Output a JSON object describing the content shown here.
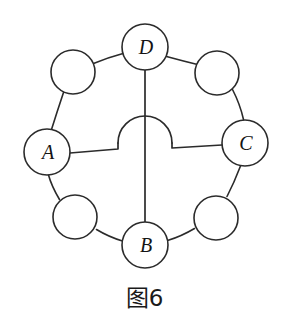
{
  "figure": {
    "caption": "图6",
    "background_color": "#ffffff",
    "stroke_color": "#2b2b2b",
    "label_color": "#141414"
  },
  "diagram": {
    "type": "ring-graph",
    "node_radius": 23,
    "ring_center": {
      "x": 145,
      "y": 145
    },
    "nodes": [
      {
        "id": "D",
        "label": "D",
        "labeled": true,
        "x": 145,
        "y": 47,
        "r": 23,
        "position": "top"
      },
      {
        "id": "NE",
        "label": "",
        "labeled": false,
        "x": 217,
        "y": 73,
        "r": 22,
        "position": "top-right"
      },
      {
        "id": "C",
        "label": "C",
        "labeled": true,
        "x": 245,
        "y": 143,
        "r": 23,
        "position": "right"
      },
      {
        "id": "SE",
        "label": "",
        "labeled": false,
        "x": 216,
        "y": 218,
        "r": 22,
        "position": "bottom-right"
      },
      {
        "id": "B",
        "label": "B",
        "labeled": true,
        "x": 145,
        "y": 245,
        "r": 23,
        "position": "bottom"
      },
      {
        "id": "SW",
        "label": "",
        "labeled": false,
        "x": 75,
        "y": 217,
        "r": 22,
        "position": "bottom-left"
      },
      {
        "id": "A",
        "label": "A",
        "labeled": true,
        "x": 47,
        "y": 152,
        "r": 23,
        "position": "left"
      },
      {
        "id": "NW",
        "label": "",
        "labeled": false,
        "x": 73,
        "y": 72,
        "r": 22,
        "position": "top-left"
      }
    ],
    "ring_edges": [
      {
        "from": "D",
        "to": "NE",
        "kind": "arc"
      },
      {
        "from": "NE",
        "to": "C",
        "kind": "arc"
      },
      {
        "from": "C",
        "to": "SE",
        "kind": "arc"
      },
      {
        "from": "SE",
        "to": "B",
        "kind": "arc"
      },
      {
        "from": "B",
        "to": "SW",
        "kind": "arc"
      },
      {
        "from": "SW",
        "to": "A",
        "kind": "arc"
      },
      {
        "from": "A",
        "to": "NW",
        "kind": "arc"
      },
      {
        "from": "NW",
        "to": "D",
        "kind": "arc"
      }
    ],
    "chords": [
      {
        "from": "D",
        "to": "B",
        "kind": "straight-vertical",
        "crosses": "under"
      },
      {
        "from": "A",
        "to": "C",
        "kind": "straight-horizontal-with-bridge",
        "crosses": "over",
        "bridge_radius": 22
      }
    ]
  }
}
